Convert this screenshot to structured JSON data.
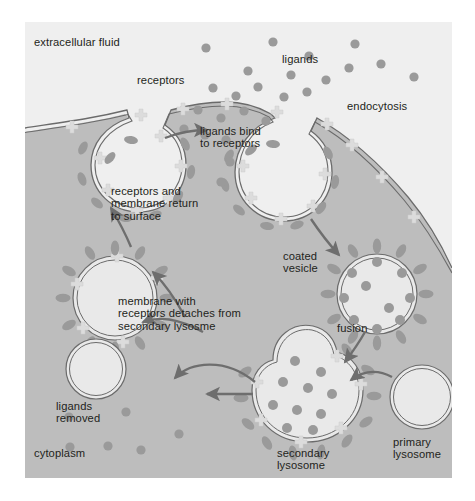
{
  "diagram": {
    "type": "biology-process-cycle"
  },
  "colors": {
    "extracellular_fluid": "#efefef",
    "cytoplasm": "#bdbdbd",
    "vesicle_lumen": "#e9e9e9",
    "membrane_line": "#6b6b6b",
    "ligand": "#9a9a9a",
    "receptor": "#d9d9d9",
    "arrow": "#6e6e6e",
    "text": "#231f20",
    "page_background": "#ffffff"
  },
  "labels": {
    "extracellular_fluid": "extracellular fluid",
    "cytoplasm": "cytoplasm",
    "receptors": "receptors",
    "ligands": "ligands",
    "endocytosis": "endocytosis",
    "ligands_bind_to_receptors": "ligands bind\nto receptors",
    "coated_vesicle": "coated\nvesicle",
    "fusion": "fusion",
    "primary_lysosome": "primary\nlysosome",
    "secondary_lysosome": "secondary\nlysosome",
    "membrane_detaches": "membrane with\nreceptors detaches from\nsecondary lysosme",
    "ligands_removed": "ligands\nremoved",
    "receptors_return": "receptors and\nmembrane return\nto surface"
  },
  "structures": [
    {
      "name": "plasma-membrane",
      "role": "cell boundary separating extracellular fluid from cytoplasm"
    },
    {
      "name": "coated-pit-left",
      "role": "invagination recycling receptors back to surface"
    },
    {
      "name": "coated-pit-right",
      "role": "invagination undergoing endocytosis"
    },
    {
      "name": "coated-vesicle",
      "role": "internalized vesicle coated with receptors"
    },
    {
      "name": "primary-lysosome",
      "role": "lysosome prior to fusion"
    },
    {
      "name": "secondary-lysosome",
      "role": "vesicle fused with lysosome, ligands being removed"
    },
    {
      "name": "recycling-vesicle",
      "role": "membrane and receptors returning to the cell surface"
    },
    {
      "name": "empty-vesicle",
      "role": "vesicle after ligands removed"
    }
  ],
  "arrows": [
    {
      "name": "arrow-binding",
      "from": "receptors",
      "to": "ligands bind to receptors"
    },
    {
      "name": "arrow-endocytosis",
      "from": "coated pit",
      "to": "coated vesicle"
    },
    {
      "name": "arrow-fusion",
      "from": "coated vesicle",
      "to": "secondary lysosome"
    },
    {
      "name": "arrow-lysosome-in",
      "from": "primary lysosome",
      "to": "secondary lysosome"
    },
    {
      "name": "arrow-detach",
      "from": "secondary lysosome",
      "to": "recycling vesicle"
    },
    {
      "name": "arrow-ligands-removed",
      "from": "secondary lysosome interior",
      "to": "empty vesicle"
    },
    {
      "name": "arrow-return",
      "from": "recycling vesicle",
      "to": "plasma membrane"
    }
  ]
}
